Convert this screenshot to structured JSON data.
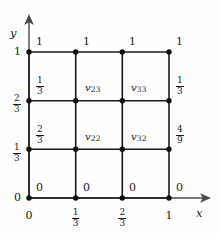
{
  "figure": {
    "type": "grid-diagram",
    "colors": {
      "line": "#1a1a1a",
      "node": "#111111",
      "background": "#fefefe",
      "text": "#1a1a1a"
    }
  },
  "axes": {
    "x_label": "x",
    "y_label": "y",
    "x_ticks": [
      {
        "value": "0",
        "kind": "integer"
      },
      {
        "num": "1",
        "den": "3",
        "kind": "fraction"
      },
      {
        "num": "2",
        "den": "3",
        "kind": "fraction"
      },
      {
        "value": "1",
        "kind": "integer"
      }
    ],
    "y_ticks": [
      {
        "value": "0",
        "kind": "integer"
      },
      {
        "num": "1",
        "den": "3",
        "kind": "fraction"
      },
      {
        "num": "2",
        "den": "3",
        "kind": "fraction"
      },
      {
        "value": "1",
        "kind": "integer"
      }
    ]
  },
  "boundary_top": [
    {
      "value": "1"
    },
    {
      "value": "1"
    },
    {
      "value": "1"
    },
    {
      "value": "1"
    }
  ],
  "boundary_bottom": [
    {
      "value": "0"
    },
    {
      "value": "0"
    },
    {
      "value": "0"
    },
    {
      "value": "0"
    }
  ],
  "boundary_left": [
    {
      "num": "1",
      "den": "3",
      "kind": "fraction"
    },
    {
      "num": "2",
      "den": "3",
      "kind": "fraction"
    }
  ],
  "boundary_right": [
    {
      "num": "1",
      "den": "3",
      "kind": "fraction"
    },
    {
      "num": "4",
      "den": "9",
      "kind": "fraction"
    }
  ],
  "corner_left_top": "1",
  "corner_left_bottom": "0",
  "unknowns": [
    {
      "name": "v",
      "sub": "23"
    },
    {
      "name": "v",
      "sub": "33"
    },
    {
      "name": "v",
      "sub": "22"
    },
    {
      "name": "v",
      "sub": "32"
    }
  ],
  "grid": {
    "columns": 3,
    "rows": 3,
    "node_count": 16
  }
}
